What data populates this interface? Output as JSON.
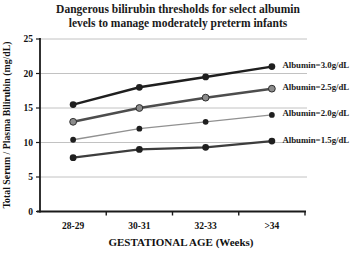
{
  "chart_data": {
    "type": "line",
    "title": "Dangerous bilirubin thresholds for select albumin levels to manage moderately preterm infants",
    "xlabel": "GESTATIONAL AGE (Weeks)",
    "ylabel": "Total Serum / Plasma Bilirubin (mg/dL)",
    "categories": [
      "28-29",
      "30-31",
      "32-33",
      ">34"
    ],
    "y_ticks": [
      0,
      5,
      10,
      15,
      20,
      25
    ],
    "ylim": [
      0,
      25
    ],
    "grid": true,
    "background": "#ffffff",
    "grid_color": "#b3b3b3",
    "axis_color": "#1a1a1a",
    "text_color": "#111111",
    "legend_position": "line-end-labels",
    "series": [
      {
        "name": "Albumin=3.0g/dL",
        "values": [
          15.5,
          18,
          19.5,
          21
        ],
        "line_color": "#1f1f1f",
        "line_width": 2.4,
        "marker_fill": "#1f1f1f",
        "marker_stroke": "",
        "marker_radius": 3.4
      },
      {
        "name": "Albumin=2.5g/dL",
        "values": [
          13,
          15,
          16.5,
          17.8
        ],
        "line_color": "#4d4d4d",
        "line_width": 2.5,
        "marker_fill": "#8c8c8c",
        "marker_stroke": "#2e2e2e",
        "marker_radius": 3.4
      },
      {
        "name": "Albumin=2.0g/dL",
        "values": [
          10.4,
          12,
          13,
          14
        ],
        "line_color": "#919191",
        "line_width": 1.3,
        "marker_fill": "#1f1f1f",
        "marker_stroke": "",
        "marker_radius": 2.9
      },
      {
        "name": "Albumin=1.5g/dL",
        "values": [
          7.8,
          9,
          9.3,
          10.2
        ],
        "line_color": "#3d3d3d",
        "line_width": 2.2,
        "marker_fill": "#1f1f1f",
        "marker_stroke": "",
        "marker_radius": 3.4
      }
    ]
  }
}
